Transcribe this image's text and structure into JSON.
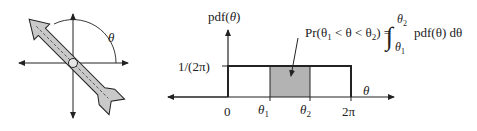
{
  "left_figure": {
    "angle_label": "θ",
    "angle_degrees": 135
  },
  "right_figure": {
    "y_axis_label": "pdf(θ)",
    "x_axis_label": "θ",
    "level_label": "1/(2π)",
    "ticks": [
      {
        "label": "0",
        "sub": ""
      },
      {
        "label": "θ",
        "sub": "1"
      },
      {
        "label": "θ",
        "sub": "2"
      },
      {
        "label": "2π",
        "sub": ""
      }
    ],
    "formula": {
      "lhs": "Pr(θ",
      "lhs_sub1": "1",
      "mid": " < θ < θ",
      "lhs_sub2": "2",
      "eq": ") =",
      "integral": "∫",
      "upper": "θ",
      "upper_sub": "2",
      "lower": "θ",
      "lower_sub": "1",
      "integrand": "pdf(θ) dθ"
    },
    "colors": {
      "shaded": "#b3b3b3",
      "line": "#222222"
    }
  }
}
